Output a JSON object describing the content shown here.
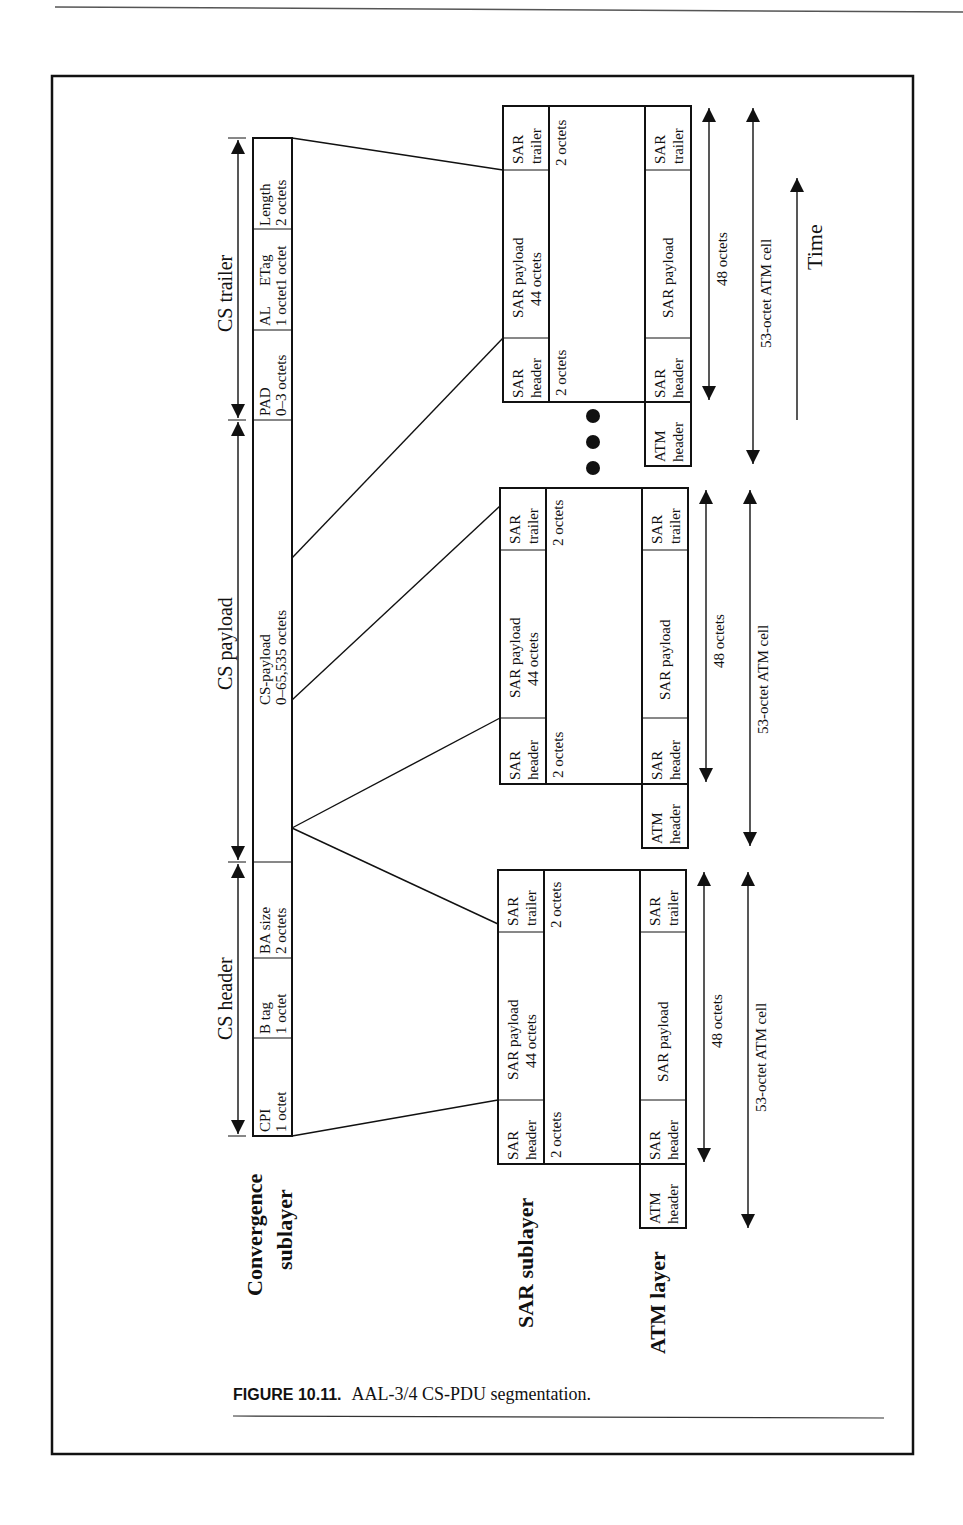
{
  "figure": {
    "caption_label": "FIGURE 10.11.",
    "caption_text": "AAL-3/4 CS-PDU segmentation."
  },
  "layers": {
    "convergence_line1": "Convergence",
    "convergence_line2": "sublayer",
    "sar": "SAR sublayer",
    "atm": "ATM layer"
  },
  "cs_pdu": {
    "span_labels": {
      "header": "CS header",
      "payload": "CS payload",
      "trailer": "CS trailer"
    },
    "fields": [
      {
        "name": "CPI",
        "size": "1 octet"
      },
      {
        "name": "B tag",
        "size": "1 octet"
      },
      {
        "name": "BA size",
        "size": "2 octets"
      },
      {
        "name": "CS-payload",
        "size": "0–65,535 octets"
      },
      {
        "name": "PAD",
        "size": "0–3 octets"
      },
      {
        "name": "AL",
        "size": "1 octet"
      },
      {
        "name": "ETag",
        "size": "1 octet"
      },
      {
        "name": "Length",
        "size": "2 octets"
      }
    ]
  },
  "sar_cell": {
    "header": "SAR header",
    "header_l1": "SAR",
    "header_l2": "header",
    "header_size": "2 octets",
    "payload_l1": "SAR payload",
    "payload_l2": "44 octets",
    "trailer_l1": "SAR",
    "trailer_l2": "trailer",
    "trailer_size": "2 octets"
  },
  "atm_cell": {
    "atm_header_l1": "ATM",
    "atm_header_l2": "header",
    "sar_header_l1": "SAR",
    "sar_header_l2": "header",
    "sar_payload": "SAR payload",
    "sar_trailer_l1": "SAR",
    "sar_trailer_l2": "trailer",
    "span_48": "48 octets",
    "span_53": "53-octet ATM cell"
  },
  "time_label": "Time"
}
